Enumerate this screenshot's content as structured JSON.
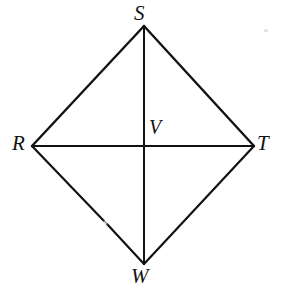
{
  "figure": {
    "type": "geometry-diagram",
    "shape_name": "rhombus RSTW with diagonals",
    "background_color": "#ffffff",
    "stroke_color": "#121212",
    "canvas": {
      "width": 285,
      "height": 300
    },
    "vertices": [
      {
        "id": "S",
        "label": "S",
        "x": 144,
        "y": 26,
        "label_x": 134,
        "label_y": 3,
        "role": "top-vertex"
      },
      {
        "id": "R",
        "label": "R",
        "x": 32,
        "y": 146,
        "label_x": 12,
        "label_y": 133,
        "role": "left-vertex"
      },
      {
        "id": "T",
        "label": "T",
        "x": 254,
        "y": 146,
        "label_x": 257,
        "label_y": 133,
        "role": "right-vertex"
      },
      {
        "id": "W",
        "label": "W",
        "x": 144,
        "y": 264,
        "label_x": 131,
        "label_y": 266,
        "role": "bottom-vertex"
      },
      {
        "id": "V",
        "label": "V",
        "x": 144,
        "y": 146,
        "label_x": 149,
        "label_y": 117,
        "role": "diagonal-intersection"
      }
    ],
    "edges": [
      {
        "id": "RS",
        "from": "R",
        "to": "S",
        "kind": "side"
      },
      {
        "id": "ST",
        "from": "S",
        "to": "T",
        "kind": "side"
      },
      {
        "id": "TW",
        "from": "T",
        "to": "W",
        "kind": "side"
      },
      {
        "id": "WR",
        "from": "W",
        "to": "R",
        "kind": "side"
      }
    ],
    "diagonals": [
      {
        "id": "RT",
        "from": "R",
        "to": "T",
        "kind": "diagonal",
        "orientation": "horizontal"
      },
      {
        "id": "SW",
        "from": "S",
        "to": "W",
        "kind": "diagonal",
        "orientation": "vertical"
      }
    ],
    "labels": {
      "s": "S",
      "r": "R",
      "t": "T",
      "w": "W",
      "v": "V"
    }
  }
}
